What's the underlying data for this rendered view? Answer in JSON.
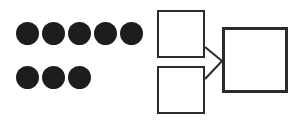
{
  "canvas": {
    "width": 296,
    "height": 120,
    "background": "#ffffff"
  },
  "dot_group": {
    "label": "dot-array",
    "dot_color": "#1d1d1d",
    "dot_diameter": 23,
    "total_count": 8,
    "rows": [
      {
        "label": "top-row",
        "count": 5,
        "y": 22,
        "xs": [
          16,
          42,
          68,
          94,
          120
        ]
      },
      {
        "label": "bottom-row",
        "count": 3,
        "y": 66,
        "xs": [
          16,
          42,
          68
        ]
      }
    ]
  },
  "diagram": {
    "label": "box-flow-diagram",
    "stroke_color": "#2b2b2b",
    "fill_color": "#ffffff",
    "nodes": [
      {
        "name": "top-left-box",
        "size": "small",
        "x": 7,
        "y": 10,
        "w": 48,
        "h": 48,
        "text": ""
      },
      {
        "name": "bottom-left-box",
        "size": "small",
        "x": 7,
        "y": 66,
        "w": 48,
        "h": 48,
        "text": ""
      },
      {
        "name": "right-box",
        "size": "large",
        "x": 72,
        "y": 27,
        "w": 66,
        "h": 66,
        "text": ""
      }
    ],
    "edges": [
      {
        "name": "edge-top-left-to-right",
        "from": "top-left-box",
        "to": "right-box",
        "x1": 55,
        "y1": 47,
        "x2": 72,
        "y2": 61
      },
      {
        "name": "edge-bottom-left-to-right",
        "from": "bottom-left-box",
        "to": "right-box",
        "x1": 55,
        "y1": 79,
        "x2": 72,
        "y2": 61
      }
    ]
  }
}
